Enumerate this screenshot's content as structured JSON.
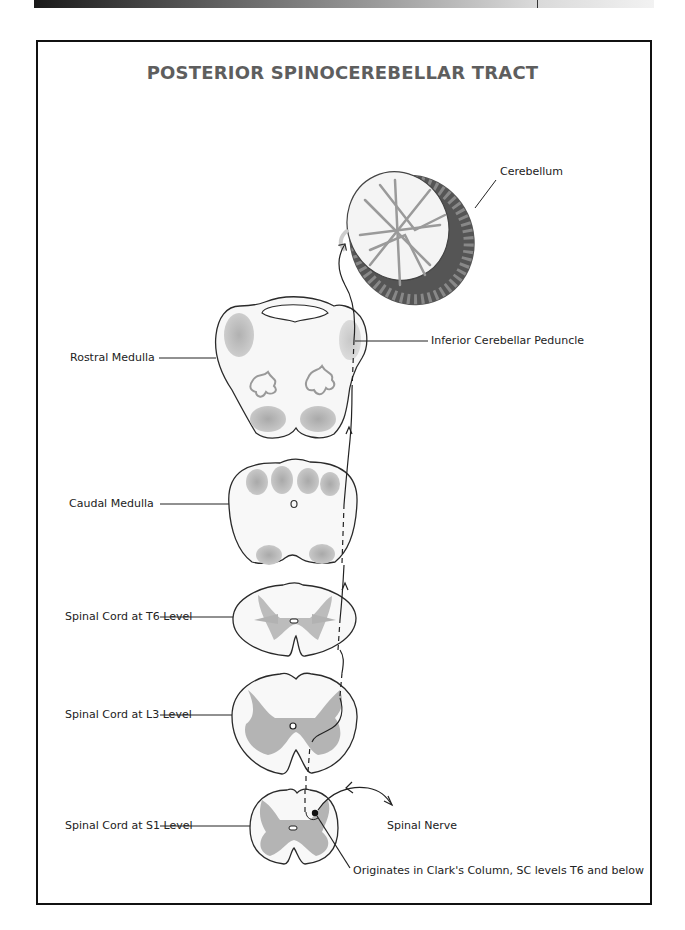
{
  "title": "POSTERIOR SPINOCEREBELLAR TRACT",
  "labels": {
    "cerebellum": "Cerebellum",
    "rostral_medulla": "Rostral Medulla",
    "inferior_cerebellar_peduncle": "Inferior Cerebellar Peduncle",
    "caudal_medulla": "Caudal Medulla",
    "spinal_cord_t6": "Spinal Cord at T6 Level",
    "spinal_cord_l3": "Spinal Cord at L3 Level",
    "spinal_cord_s1": "Spinal Cord at S1 Level",
    "spinal_nerve": "Spinal Nerve",
    "origin": "Originates in Clark's Column, SC levels T6 and below"
  },
  "colors": {
    "frame": "#111111",
    "title": "#5e5e5e",
    "gray_matter": "#a8a8a8",
    "tract_nuclei": "#b5b5b5",
    "outline": "#2a2a2a"
  }
}
